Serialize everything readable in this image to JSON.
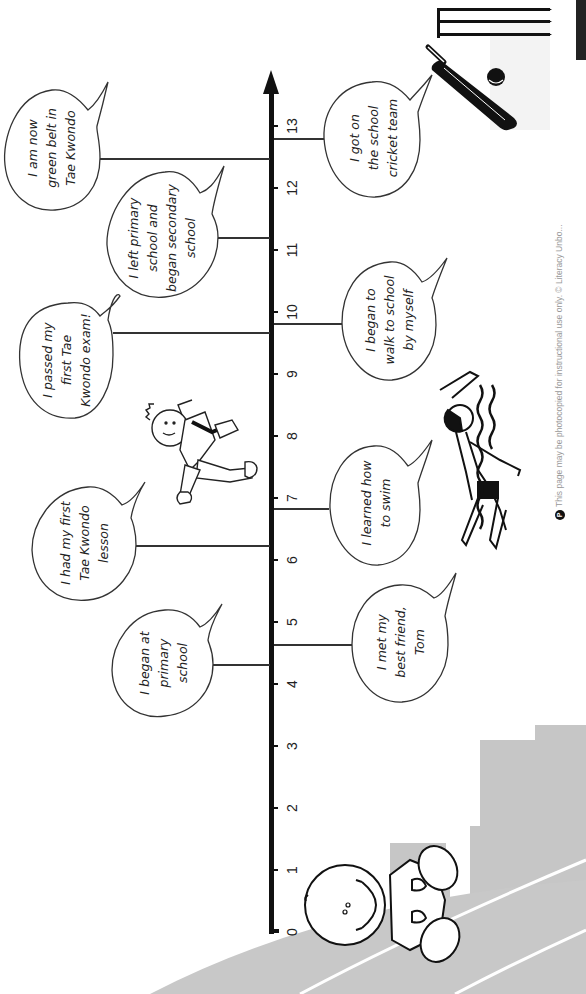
{
  "worksheet": {
    "orientation": "rotated 90deg clockwise (portrait scan of landscape timeline)",
    "footer_text": "This page may be photocopied for instructional use only. © Literacy Unbo...",
    "footer_badge": "P",
    "colors": {
      "axis": "#111111",
      "text": "#222222",
      "background_scene": "#c8c8c8",
      "page": "#ffffff"
    }
  },
  "timeline": {
    "axis_label_ticks": [
      "0",
      "1",
      "2",
      "3",
      "4",
      "5",
      "6",
      "7",
      "8",
      "9",
      "10",
      "11",
      "12",
      "13"
    ],
    "events_left": [
      {
        "age": 12.5,
        "text": "I am now\ngreen belt in\nTae Kwondo"
      },
      {
        "age": 11.2,
        "text": "I left primary\nschool and\nbegan secondary\nschool"
      },
      {
        "age": 9.7,
        "text": "I passed my\nfirst Tae\nKwondo exam!"
      },
      {
        "age": 6.2,
        "text": "I had my first\nTae Kwondo\nlesson"
      },
      {
        "age": 4.3,
        "text": "I began at\nprimary\nschool"
      }
    ],
    "events_right": [
      {
        "age": 12.7,
        "text": "I got on\nthe school\ncricket team"
      },
      {
        "age": 9.8,
        "text": "I began to\nwalk to school\nby myself"
      },
      {
        "age": 6.8,
        "text": "I learned how\nto swim"
      },
      {
        "age": 4.6,
        "text": "I met my\nbest friend,\nTom"
      }
    ]
  },
  "illustrations": {
    "baby": "baby-illustration",
    "taekwondo": "taekwondo-kid-illustration",
    "swimmer": "swimmer-illustration",
    "cricket": "cricket-bat-ball-stumps-illustration",
    "skyline": "city-skyline-background"
  }
}
